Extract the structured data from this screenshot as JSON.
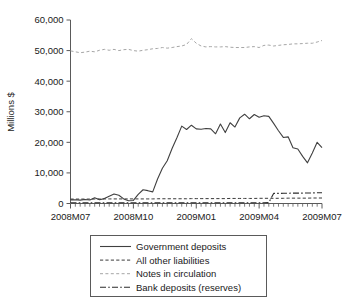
{
  "chart_data": {
    "type": "line",
    "title": "",
    "xlabel": "",
    "ylabel": "Millions $",
    "ylim": [
      0,
      60000
    ],
    "grid": false,
    "legend_position": "below-axes",
    "ytick_labels": [
      "0",
      "10,000",
      "20,000",
      "30,000",
      "40,000",
      "50,000",
      "60,000"
    ],
    "ytick_values": [
      0,
      10000,
      20000,
      30000,
      40000,
      50000,
      60000
    ],
    "xtick_labels": [
      "2008M07",
      "2008M10",
      "2009M01",
      "2009M04",
      "2009M07"
    ],
    "xtick_values": [
      0,
      13,
      26,
      39,
      52
    ],
    "x_minor_count": 53,
    "x_index_range": [
      0,
      52
    ],
    "x_note": "weekly observations spanning 2008M07 through 2009M07",
    "series": [
      {
        "name": "Government deposits",
        "style": "solid",
        "color": "#404040",
        "width": 1.1,
        "values": [
          1200,
          1250,
          1100,
          1300,
          1150,
          1900,
          1250,
          1600,
          2400,
          3100,
          2700,
          1500,
          900,
          1000,
          3000,
          4500,
          4200,
          3800,
          8000,
          11500,
          14000,
          18000,
          21500,
          25300,
          24200,
          25600,
          24400,
          24300,
          24500,
          24400,
          22800,
          26000,
          23200,
          26400,
          25000,
          28000,
          29200,
          27700,
          29100,
          28200,
          28700,
          28500,
          26200,
          23800,
          21600,
          21800,
          18200,
          17800,
          15400,
          13300,
          16500,
          20000,
          18300
        ]
      },
      {
        "name": "All other liabilities",
        "style": "dashed",
        "color": "#3a3a3a",
        "width": 1.0,
        "values": [
          1450,
          1450,
          1450,
          1450,
          1450,
          1450,
          1500,
          1500,
          1500,
          1500,
          1500,
          1500,
          1500,
          1500,
          1500,
          1500,
          1500,
          1500,
          1550,
          1550,
          1550,
          1550,
          1550,
          1550,
          1550,
          1600,
          1600,
          1600,
          1600,
          1600,
          1600,
          1600,
          1600,
          1650,
          1650,
          1650,
          1650,
          1650,
          1650,
          1700,
          1700,
          1700,
          1700,
          1700,
          1700,
          1750,
          1750,
          1750,
          1750,
          1750,
          1800,
          1800,
          1800
        ]
      },
      {
        "name": "Notes in circulation",
        "style": "light-dashed",
        "color": "#a6a6a6",
        "width": 1.0,
        "values": [
          49900,
          49600,
          49300,
          49500,
          49800,
          49600,
          50100,
          50400,
          50100,
          50400,
          50000,
          50300,
          50400,
          50000,
          49800,
          50100,
          50300,
          50600,
          50700,
          51000,
          50800,
          51000,
          51300,
          51500,
          52000,
          53900,
          52400,
          51500,
          51200,
          51300,
          51200,
          51200,
          51300,
          51100,
          51000,
          51000,
          51000,
          51200,
          51300,
          51000,
          51700,
          51800,
          51500,
          51700,
          51900,
          52000,
          52200,
          52200,
          52300,
          52400,
          52400,
          52800,
          53300
        ]
      },
      {
        "name": "Bank deposits (reserves)",
        "style": "dash-dot",
        "color": "#2b2b2b",
        "width": 1.1,
        "values": [
          250,
          250,
          250,
          250,
          250,
          250,
          250,
          250,
          250,
          250,
          250,
          250,
          250,
          250,
          250,
          250,
          250,
          250,
          250,
          250,
          250,
          250,
          250,
          250,
          250,
          250,
          250,
          250,
          250,
          250,
          250,
          250,
          250,
          250,
          250,
          250,
          250,
          250,
          250,
          250,
          250,
          300,
          3300,
          3300,
          3350,
          3350,
          3400,
          3400,
          3400,
          3450,
          3450,
          3500,
          3500
        ]
      }
    ]
  },
  "legend": {
    "items": [
      {
        "label": "Government deposits"
      },
      {
        "label": "All other liabilities"
      },
      {
        "label": "Notes in circulation"
      },
      {
        "label": "Bank deposits (reserves)"
      }
    ]
  }
}
